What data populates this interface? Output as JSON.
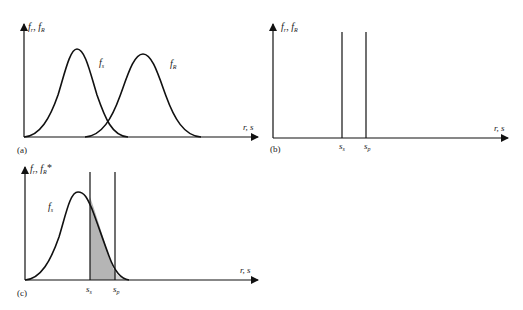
{
  "figure": {
    "panels": [
      {
        "id": "a",
        "tag": "(a)",
        "y_axis_label": "f_r, f_R",
        "y_axis_label_main": "f",
        "y_axis_label_sub1": "r",
        "y_axis_label_sub2": "R",
        "x_axis_label": "r, s",
        "curves": [
          {
            "name": "f_s",
            "label_main": "f",
            "label_sub": "s",
            "peak_x": 77,
            "shape": "bell"
          },
          {
            "name": "f_R",
            "label_main": "f",
            "label_sub": "R",
            "peak_x": 143,
            "shape": "bell"
          }
        ]
      },
      {
        "id": "b",
        "tag": "(b)",
        "y_axis_label": "f_r, f_R",
        "y_axis_label_main": "f",
        "y_axis_label_sub1": "r",
        "y_axis_label_sub2": "R",
        "x_axis_label": "r, s",
        "markers": [
          {
            "name": "s_s",
            "label_main": "s",
            "label_sub": "s"
          },
          {
            "name": "s_p",
            "label_main": "s",
            "label_sub": "p"
          }
        ]
      },
      {
        "id": "c",
        "tag": "(c)",
        "y_axis_label": "f_r, f_R*",
        "y_axis_label_main": "f",
        "y_axis_label_sub1": "r",
        "y_axis_label_sub2": "R",
        "y_axis_label_star": "*",
        "x_axis_label": "r, s",
        "curve": {
          "name": "f_s",
          "label_main": "f",
          "label_sub": "s"
        },
        "markers": [
          {
            "name": "s_s",
            "label_main": "s",
            "label_sub": "s"
          },
          {
            "name": "s_p",
            "label_main": "s",
            "label_sub": "p"
          }
        ],
        "shaded_region": {
          "from": "s_s",
          "to": "curve tail",
          "color_dark": "#b5b5b5",
          "color_light": "#d6d6d6"
        }
      }
    ]
  }
}
